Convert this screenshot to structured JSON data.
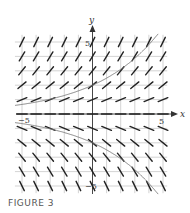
{
  "figure": {
    "caption": "FIGURE 3",
    "type": "slope_field",
    "x_axis_label": "x",
    "y_axis_label": "y",
    "tick_labels": {
      "x_min": "−5",
      "x_max": "5",
      "y_max": "5",
      "y_min": "−5"
    },
    "x_range": [
      -5,
      5
    ],
    "y_range": [
      -5,
      5
    ],
    "grid_step": 1,
    "solution_curves": [
      {
        "name": "upper",
        "formula": "y = 2e^(x/5)"
      },
      {
        "name": "lower",
        "formula": "y = -2e^(x/5)"
      }
    ],
    "colors": {
      "grid": "#c8c8c8",
      "axis": "#333333",
      "slope": "#222222",
      "curve": "#777777",
      "caption": "#555555"
    }
  }
}
